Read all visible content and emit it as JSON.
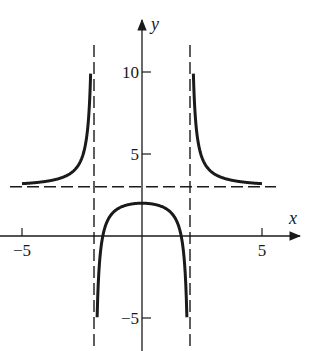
{
  "chart_data": {
    "type": "line",
    "title": "",
    "xlabel": "x",
    "ylabel": "y",
    "function_hint": "f(x) = 3 + 4/(x^2 - 4)",
    "xlim": [
      -5.9,
      6.9
    ],
    "ylim": [
      -7,
      11.9
    ],
    "x_ticks": [
      -5,
      5
    ],
    "x_tick_labels": [
      "−5",
      "5"
    ],
    "y_ticks": [
      10,
      5,
      -5
    ],
    "y_tick_labels": [
      "10",
      "5",
      "−5"
    ],
    "grid": false,
    "legend": null,
    "asymptotes": {
      "horizontal": [
        3
      ],
      "vertical": [
        -2,
        2
      ],
      "style": "dashed"
    },
    "series": [
      {
        "name": "left-upper-branch",
        "x": [
          -5,
          -4.5,
          -4,
          -3.5,
          -3,
          -2.75,
          -2.5,
          -2.35,
          -2.25,
          -2.18,
          -2.14
        ],
        "y": [
          3.19,
          3.25,
          3.33,
          3.48,
          3.8,
          4.55,
          4.78,
          6.26,
          7.71,
          8.24,
          10
        ]
      },
      {
        "name": "middle-lower-branch",
        "x": [
          -1.87,
          -1.8,
          -1.6,
          -1.2,
          -0.6,
          0,
          0.6,
          1.2,
          1.6,
          1.8,
          1.87
        ],
        "y": [
          -5,
          -2.26,
          0.22,
          1.44,
          1.9,
          2,
          1.9,
          1.44,
          0.22,
          -2.26,
          -5
        ]
      },
      {
        "name": "right-upper-branch",
        "x": [
          2.14,
          2.18,
          2.25,
          2.35,
          2.5,
          2.75,
          3,
          3.5,
          4,
          4.5,
          5
        ],
        "y": [
          10,
          8.24,
          7.71,
          6.26,
          4.78,
          4.55,
          3.8,
          3.48,
          3.33,
          3.25,
          3.19
        ]
      }
    ]
  }
}
